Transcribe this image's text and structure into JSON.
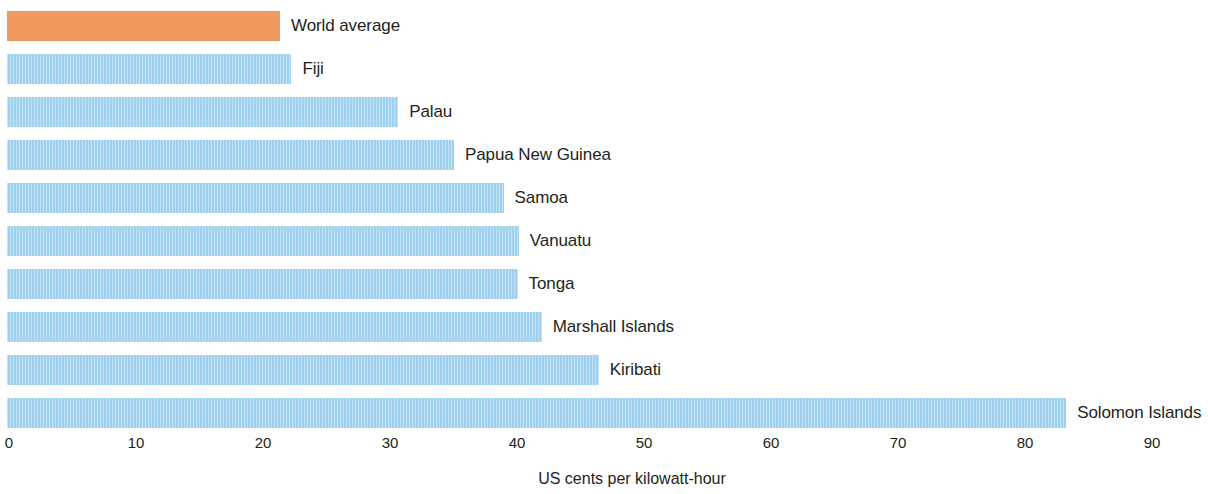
{
  "chart_data": {
    "type": "bar",
    "orientation": "horizontal",
    "title": "",
    "subtitle": "",
    "xlabel": "US cents per kilowatt-hour",
    "ylabel": "",
    "xlim": [
      0,
      93
    ],
    "xticks": [
      0,
      10,
      20,
      30,
      40,
      50,
      60,
      70,
      80,
      90
    ],
    "xtick_labels": [
      "0",
      "10",
      "20",
      "30",
      "40",
      "50",
      "60",
      "70",
      "80",
      "90"
    ],
    "grid": false,
    "legend": false,
    "categories": [
      "World average",
      "Fiji",
      "Palau",
      "Papua New Guinea",
      "Samoa",
      "Vanuatu",
      "Tonga",
      "Marshall Islands",
      "Kiribati",
      "Solomon Islands"
    ],
    "values": [
      21.5,
      22.4,
      30.8,
      35.2,
      39.1,
      40.3,
      40.2,
      42.1,
      46.6,
      83.4
    ],
    "bars": [
      {
        "label": "World average",
        "value": 21.5,
        "color": "#f0995e",
        "highlight": true
      },
      {
        "label": "Fiji",
        "value": 22.4,
        "color": "#9ed1ef",
        "highlight": false
      },
      {
        "label": "Palau",
        "value": 30.8,
        "color": "#9ed1ef",
        "highlight": false
      },
      {
        "label": "Papua New Guinea",
        "value": 35.2,
        "color": "#9ed1ef",
        "highlight": false
      },
      {
        "label": "Samoa",
        "value": 39.1,
        "color": "#9ed1ef",
        "highlight": false
      },
      {
        "label": "Vanuatu",
        "value": 40.3,
        "color": "#9ed1ef",
        "highlight": false
      },
      {
        "label": "Tonga",
        "value": 40.2,
        "color": "#9ed1ef",
        "highlight": false
      },
      {
        "label": "Marshall Islands",
        "value": 42.1,
        "color": "#9ed1ef",
        "highlight": false
      },
      {
        "label": "Kiribati",
        "value": 46.6,
        "color": "#9ed1ef",
        "highlight": false
      },
      {
        "label": "Solomon Islands",
        "value": 83.4,
        "color": "#9ed1ef",
        "highlight": false
      }
    ],
    "colors": {
      "bar_default": "#9ed1ef",
      "bar_highlight": "#f0995e",
      "text": "#231f20",
      "background": "#ffffff"
    }
  },
  "layout": {
    "plot_left_px": 7,
    "px_per_unit": 12.7,
    "row_pitch_px": 43,
    "row_top_px": 11,
    "bar_height_px": 30,
    "label_gap_px": 11
  }
}
